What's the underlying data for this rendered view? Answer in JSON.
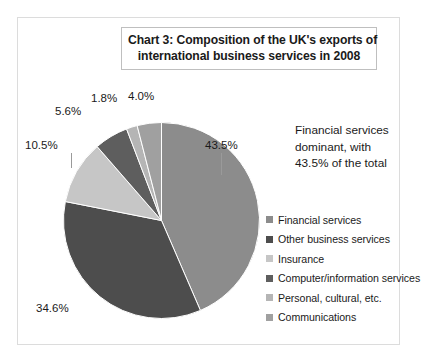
{
  "chart_data": {
    "type": "pie",
    "title": "Chart 3: Composition of the UK's exports of international business services in 2008",
    "title_lines": [
      "Chart 3: Composition of the UK's exports of",
      "international business services in 2008"
    ],
    "categories": [
      "Financial services",
      "Other business services",
      "Insurance",
      "Computer/information services",
      "Personal, cultural, etc.",
      "Communications"
    ],
    "values": [
      43.5,
      34.6,
      10.5,
      5.6,
      1.8,
      4.0
    ],
    "value_labels": [
      "43.5%",
      "34.6%",
      "10.5%",
      "5.6%",
      "1.8%",
      "4.0%"
    ],
    "colors": [
      "#8c8c8c",
      "#4d4d4d",
      "#c6c6c6",
      "#5e5e5e",
      "#b5b5b5",
      "#a0a0a0"
    ],
    "unit": "%",
    "legend_position": "right",
    "grid": false,
    "annotation": "Financial services dominant, with 43.5% of the total",
    "annotation_lines": [
      "Financial services",
      "dominant, with",
      "43.5% of the total"
    ]
  },
  "legend": {
    "items": [
      {
        "label": "Financial services",
        "color": "#8c8c8c"
      },
      {
        "label": "Other business services",
        "color": "#4d4d4d"
      },
      {
        "label": "Insurance",
        "color": "#c6c6c6"
      },
      {
        "label": "Computer/information services",
        "color": "#5e5e5e"
      },
      {
        "label": "Personal, cultural, etc.",
        "color": "#b5b5b5"
      },
      {
        "label": "Communications",
        "color": "#a0a0a0"
      }
    ]
  },
  "labels": {
    "financial": "43.5%",
    "other_business": "34.6%",
    "insurance": "10.5%",
    "computer": "5.6%",
    "personal": "1.8%",
    "communications": "4.0%"
  }
}
